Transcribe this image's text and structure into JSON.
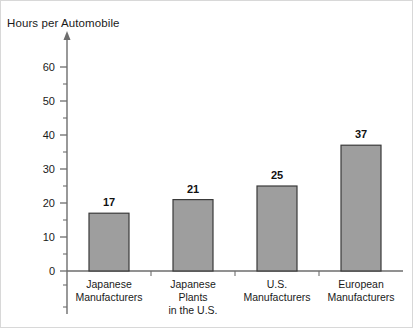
{
  "chart_data": {
    "type": "bar",
    "title": "Hours per Automobile",
    "xlabel": "",
    "ylabel": "",
    "ylim": [
      0,
      65
    ],
    "grid": false,
    "legend": null,
    "y_ticks": [
      0,
      10,
      20,
      30,
      40,
      50,
      60
    ],
    "y_minor_ticks": [
      5,
      15,
      25,
      35,
      45,
      55
    ],
    "y_axis_has_arrow": true,
    "categories": [
      "Japanese Manufacturers",
      "Japanese Plants in the U.S.",
      "U.S. Manufacturers",
      "European Manufacturers"
    ],
    "category_label_lines": [
      [
        "Japanese",
        "Manufacturers"
      ],
      [
        "Japanese",
        "Plants",
        "in the U.S."
      ],
      [
        "U.S.",
        "Manufacturers"
      ],
      [
        "European",
        "Manufacturers"
      ]
    ],
    "values": [
      17,
      21,
      25,
      37
    ],
    "value_labels": [
      "17",
      "21",
      "25",
      "37"
    ],
    "bar_fill_color": "#9e9e9e",
    "bar_edge_color": "#3a3a3a",
    "axis_color": "#6d6d6d"
  }
}
